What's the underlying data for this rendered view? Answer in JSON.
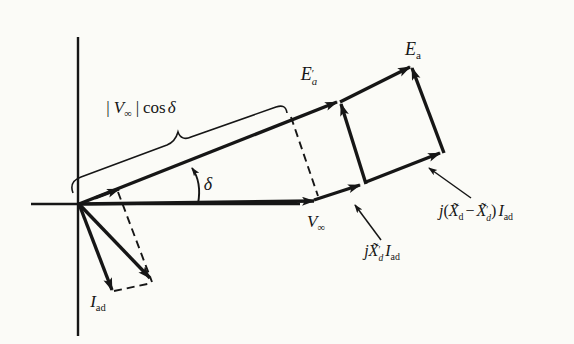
{
  "figure": {
    "background": "#fbfbf7",
    "ink": "#161616"
  },
  "labels": {
    "e_a": {
      "base": "E",
      "sub": "a"
    },
    "e_a_prime": {
      "base": "E",
      "prime": "′",
      "sub": "a"
    },
    "v_cos": {
      "open": "|",
      "v": "V",
      "vsub": "∞",
      "close": "|",
      "cos": "cos",
      "delta": "δ"
    },
    "delta": {
      "text": "δ"
    },
    "v_inf": {
      "base": "V",
      "sub": "∞"
    },
    "jxd_prime": {
      "j": "j",
      "x": "X̃",
      "prime": "′",
      "xsub": "d",
      "i": "I",
      "isub": "ad"
    },
    "jx_diff": {
      "j": "j",
      "open": "(",
      "x1": "X̃",
      "x1sub": "d",
      "minus": "−",
      "x2": "X̃",
      "prime": "′",
      "x2sub": "d",
      "close": ")",
      "i": "I",
      "isub": "ad"
    },
    "i_ad": {
      "base": "I",
      "sub": "ad"
    }
  }
}
